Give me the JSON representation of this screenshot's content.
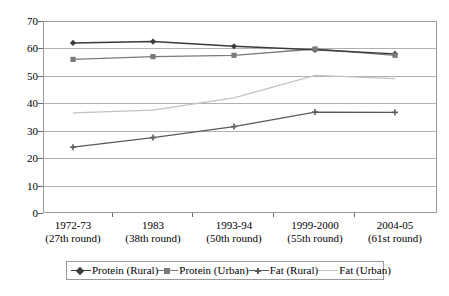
{
  "chart_data": {
    "type": "line",
    "title": "",
    "xlabel": "",
    "ylabel": "",
    "ylim": [
      0,
      70
    ],
    "ytick_step": 10,
    "grid": true,
    "legend_position": "bottom",
    "categories": [
      {
        "line1": "1972-73",
        "line2": "(27th round)"
      },
      {
        "line1": "1983",
        "line2": "(38th round)"
      },
      {
        "line1": "1993-94",
        "line2": "(50th round)"
      },
      {
        "line1": "1999-2000",
        "line2": "(55th round)"
      },
      {
        "line1": "2004-05",
        "line2": "(61st round)"
      }
    ],
    "category_labels": [
      "1972-73 (27th round)",
      "1983 (38th round)",
      "1993-94 (50th round)",
      "1999-2000 (55th round)",
      "2004-05 (61st round)"
    ],
    "yticks": [
      "0",
      "10",
      "20",
      "30",
      "40",
      "50",
      "60",
      "70"
    ],
    "series": [
      {
        "name": "Protein (Rural)",
        "marker": "diamond",
        "color": "#3b3b3b",
        "values": [
          62.0,
          62.5,
          60.8,
          59.5,
          58.0
        ]
      },
      {
        "name": "Protein (Urban)",
        "marker": "square",
        "color": "#7a7a7a",
        "values": [
          56.0,
          57.0,
          57.5,
          59.8,
          57.5
        ]
      },
      {
        "name": "Fat (Rural)",
        "marker": "cross",
        "color": "#5a5a5a",
        "values": [
          24.0,
          27.5,
          31.5,
          36.8,
          36.7
        ]
      },
      {
        "name": "Fat (Urban)",
        "marker": "none",
        "color": "#c2c2c2",
        "values": [
          36.5,
          37.5,
          42.0,
          50.2,
          49.0
        ]
      }
    ]
  },
  "legend": {
    "entries": [
      "Protein (Rural)",
      "Protein (Urban)",
      "Fat (Rural)",
      "Fat (Urban)"
    ]
  }
}
